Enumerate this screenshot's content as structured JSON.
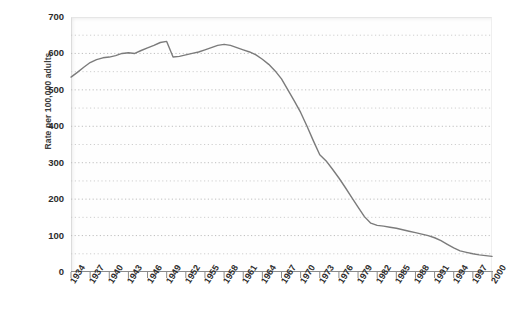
{
  "chart_data": {
    "type": "line",
    "title": "",
    "xlabel": "",
    "ylabel": "Rate per 100,000 adults",
    "xlim": [
      1934,
      2000
    ],
    "ylim": [
      0,
      700
    ],
    "grid": true,
    "legend": false,
    "y_ticks": [
      0,
      100,
      200,
      300,
      400,
      500,
      600,
      700
    ],
    "y_minor_step": 50,
    "x_ticks": [
      1934,
      1937,
      1940,
      1943,
      1946,
      1949,
      1952,
      1955,
      1958,
      1961,
      1964,
      1967,
      1970,
      1973,
      1976,
      1979,
      1982,
      1985,
      1988,
      1991,
      1994,
      1997,
      2000
    ],
    "line_color": "#7b7b7b",
    "series": [
      {
        "name": "Rate per 100,000 adults",
        "x": [
          1934,
          1935,
          1936,
          1937,
          1938,
          1939,
          1940,
          1941,
          1942,
          1943,
          1944,
          1945,
          1946,
          1947,
          1948,
          1949,
          1950,
          1951,
          1952,
          1953,
          1954,
          1955,
          1956,
          1957,
          1958,
          1959,
          1960,
          1961,
          1962,
          1963,
          1964,
          1965,
          1966,
          1967,
          1968,
          1969,
          1970,
          1971,
          1972,
          1973,
          1974,
          1975,
          1976,
          1977,
          1978,
          1979,
          1980,
          1981,
          1982,
          1983,
          1984,
          1985,
          1986,
          1987,
          1988,
          1989,
          1990,
          1991,
          1992,
          1993,
          1994,
          1995,
          1996,
          1997,
          1998,
          1999,
          2000
        ],
        "y": [
          535,
          548,
          562,
          575,
          583,
          588,
          590,
          594,
          600,
          602,
          600,
          608,
          615,
          622,
          630,
          633,
          590,
          592,
          596,
          600,
          604,
          610,
          616,
          622,
          625,
          622,
          616,
          610,
          604,
          596,
          584,
          570,
          552,
          530,
          500,
          470,
          438,
          400,
          360,
          322,
          305,
          282,
          258,
          232,
          205,
          178,
          152,
          134,
          128,
          126,
          123,
          120,
          116,
          112,
          108,
          104,
          100,
          94,
          86,
          76,
          66,
          58,
          54,
          50,
          47,
          45,
          43
        ]
      }
    ]
  },
  "axis": {
    "y_tick_labels": [
      "700",
      "600",
      "500",
      "400",
      "300",
      "200",
      "100",
      "0"
    ],
    "x_tick_labels": [
      "1934",
      "1937",
      "1940",
      "1943",
      "1946",
      "1949",
      "1952",
      "1955",
      "1958",
      "1961",
      "1964",
      "1967",
      "1970",
      "1973",
      "1976",
      "1979",
      "1982",
      "1985",
      "1988",
      "1991",
      "1994",
      "1997",
      "2000"
    ]
  }
}
